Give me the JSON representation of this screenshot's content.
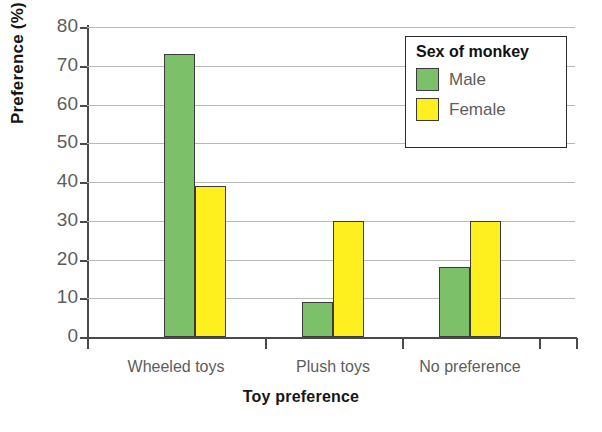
{
  "chart_data": {
    "type": "bar",
    "title": "",
    "xlabel": "Toy preference",
    "ylabel": "Preference (%)",
    "categories": [
      "Wheeled toys",
      "Plush toys",
      "No preference"
    ],
    "series": [
      {
        "name": "Male",
        "color": "#7cc16a",
        "values": [
          73,
          9,
          18
        ]
      },
      {
        "name": "Female",
        "color": "#fdf01e",
        "values": [
          39,
          30,
          30
        ]
      }
    ],
    "ylim": [
      0,
      80
    ],
    "yticks": [
      0,
      10,
      20,
      30,
      40,
      50,
      60,
      70,
      80
    ],
    "ytick_labels": [
      "0",
      "10",
      "20",
      "30",
      "40",
      "50",
      "60",
      "70",
      "80"
    ],
    "grid": true,
    "legend": {
      "title": "Sex of monkey",
      "position": "top-right",
      "entries": [
        {
          "label": "Male",
          "color": "#7cc16a"
        },
        {
          "label": "Female",
          "color": "#fdf01e"
        }
      ]
    },
    "colors": {
      "male": "#7cc16a",
      "female": "#fdf01e",
      "gridline": "#b9b9b9",
      "axis": "#4a4a4a",
      "tick_label": "#5d5d5d",
      "axis_title": "#161616",
      "background": "#ffffff"
    }
  }
}
